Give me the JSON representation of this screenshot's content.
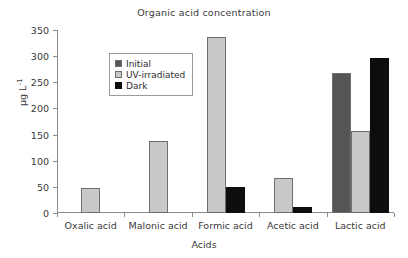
{
  "chart_data": {
    "type": "bar",
    "title": "Organic acid concentration",
    "xlabel": "Acids",
    "ylabel": "µg L⁻¹",
    "ylabel_base": "µg L",
    "ylabel_exp": "-1",
    "categories": [
      "Oxalic acid",
      "Malonic acid",
      "Formic acid",
      "Acetic acid",
      "Lactic acid"
    ],
    "series": [
      {
        "name": "Initial",
        "color": "#555555",
        "values": [
          0,
          0,
          0,
          0,
          267
        ]
      },
      {
        "name": "UV-irradiated",
        "color": "#c8c8c8",
        "values": [
          48,
          137,
          336,
          67,
          156
        ]
      },
      {
        "name": "Dark",
        "color": "#0d0d0d",
        "values": [
          0,
          0,
          50,
          11,
          296
        ]
      }
    ],
    "ylim": [
      0,
      350
    ],
    "yticks": [
      0,
      50,
      100,
      150,
      200,
      250,
      300,
      350
    ],
    "ytick_labels": [
      "0",
      "50",
      "100",
      "150",
      "200",
      "250",
      "300",
      "350"
    ],
    "grid": false,
    "legend_position": "upper-left-inside"
  }
}
